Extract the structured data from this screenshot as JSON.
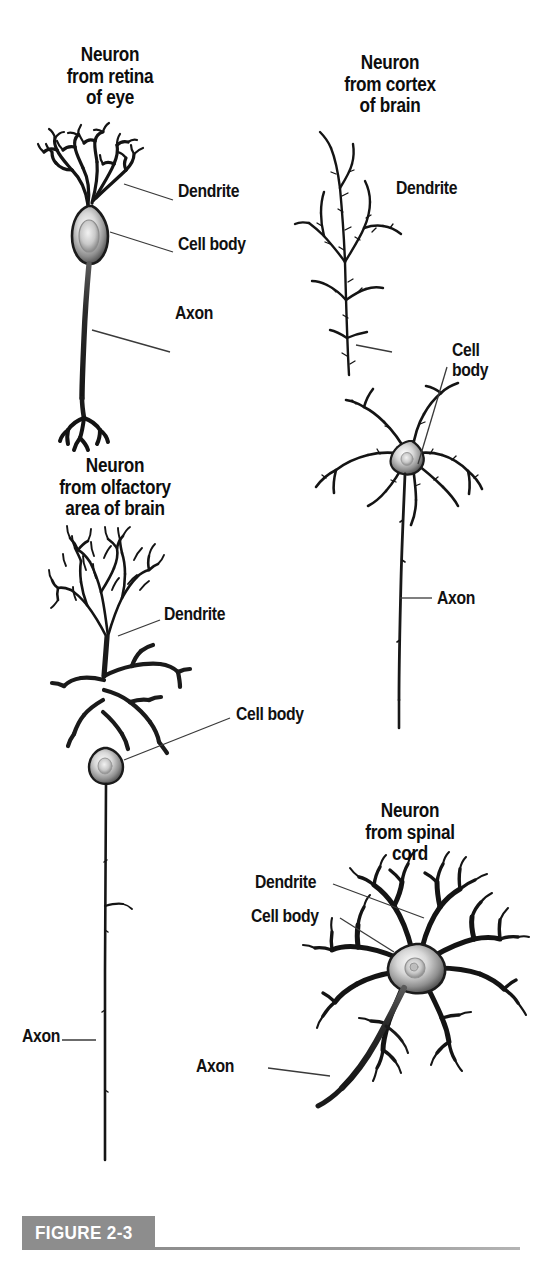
{
  "figure": {
    "caption_tag": "FIGURE 2-3",
    "background": "#ffffff",
    "ink": "#111111",
    "banner_color": "#8d8d8d"
  },
  "panels": [
    {
      "id": "retina",
      "heading": "Neuron\nfrom retina\nof eye",
      "labels": {
        "dendrite": "Dendrite",
        "cell_body": "Cell body",
        "axon": "Axon"
      }
    },
    {
      "id": "cortex",
      "heading": "Neuron\nfrom cortex\nof brain",
      "labels": {
        "dendrite": "Dendrite",
        "cell_body": "Cell\nbody",
        "axon": "Axon"
      }
    },
    {
      "id": "olfactory",
      "heading": "Neuron\nfrom olfactory\narea of brain",
      "labels": {
        "dendrite": "Dendrite",
        "cell_body": "Cell body",
        "axon": "Axon"
      }
    },
    {
      "id": "spinal",
      "heading": "Neuron\nfrom spinal\ncord",
      "labels": {
        "dendrite": "Dendrite",
        "cell_body": "Cell body",
        "axon": "Axon"
      }
    }
  ]
}
